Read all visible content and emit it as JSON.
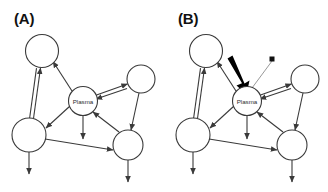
{
  "figure": {
    "background_color": "#ffffff",
    "stroke_color": "#3a3a3a",
    "thick_arrow_color": "#000000",
    "thin_arrow_color": "#8d8d8d"
  },
  "panels": [
    {
      "label": "(A)",
      "center_node_label": "Plasma",
      "node_count": 5,
      "nodes": [
        {
          "id": "top-left",
          "label": "",
          "cx": 42,
          "cy": 51,
          "r": 16.5
        },
        {
          "id": "bottom-left",
          "label": "",
          "cx": 29,
          "cy": 135,
          "r": 17.0
        },
        {
          "id": "plasma",
          "label": "Plasma",
          "cx": 83,
          "cy": 101,
          "r": 14.5
        },
        {
          "id": "right",
          "label": "",
          "cx": 141,
          "cy": 79,
          "r": 14.0
        },
        {
          "id": "bottom-right",
          "label": "",
          "cx": 128,
          "cy": 145,
          "r": 15.0
        }
      ],
      "edges": [
        {
          "from": "bottom-left",
          "to": "top-left",
          "style": "double",
          "arrow": "both"
        },
        {
          "from": "plasma",
          "to": "top-left",
          "style": "single",
          "arrow": "target"
        },
        {
          "from": "plasma",
          "to": "bottom-left",
          "style": "single",
          "arrow": "target"
        },
        {
          "from": "plasma",
          "to": "right",
          "style": "double",
          "arrow": "both"
        },
        {
          "from": "bottom-right",
          "to": "plasma",
          "style": "single",
          "arrow": "target"
        },
        {
          "from": "right",
          "to": "bottom-right",
          "style": "single",
          "arrow": "target"
        },
        {
          "from": "bottom-left",
          "to": "bottom-right",
          "style": "single",
          "arrow": "target"
        },
        {
          "from": "plasma",
          "to": "outflow",
          "style": "single",
          "arrow": "target"
        },
        {
          "from": "bottom-left",
          "to": "outflow",
          "style": "single",
          "arrow": "target"
        },
        {
          "from": "bottom-right",
          "to": "outflow",
          "style": "single",
          "arrow": "target"
        }
      ]
    },
    {
      "label": "(B)",
      "center_node_label": "Plasma",
      "node_count": 5,
      "nodes": [
        {
          "id": "top-left",
          "label": "",
          "cx": 42,
          "cy": 51,
          "r": 16.5
        },
        {
          "id": "bottom-left",
          "label": "",
          "cx": 29,
          "cy": 135,
          "r": 17.0
        },
        {
          "id": "plasma",
          "label": "Plasma",
          "cx": 83,
          "cy": 101,
          "r": 14.5
        },
        {
          "id": "right",
          "label": "",
          "cx": 141,
          "cy": 79,
          "r": 14.0
        },
        {
          "id": "bottom-right",
          "label": "",
          "cx": 128,
          "cy": 145,
          "r": 15.0
        }
      ],
      "edges": [
        {
          "from": "bottom-left",
          "to": "top-left",
          "style": "double",
          "arrow": "both"
        },
        {
          "from": "plasma",
          "to": "top-left",
          "style": "single",
          "arrow": "target"
        },
        {
          "from": "plasma",
          "to": "bottom-left",
          "style": "single",
          "arrow": "target"
        },
        {
          "from": "plasma",
          "to": "right",
          "style": "double",
          "arrow": "both"
        },
        {
          "from": "bottom-right",
          "to": "plasma",
          "style": "single",
          "arrow": "target"
        },
        {
          "from": "right",
          "to": "bottom-right",
          "style": "single",
          "arrow": "target"
        },
        {
          "from": "bottom-left",
          "to": "bottom-right",
          "style": "single",
          "arrow": "target"
        },
        {
          "from": "plasma",
          "to": "outflow",
          "style": "single",
          "arrow": "target"
        },
        {
          "from": "bottom-left",
          "to": "outflow",
          "style": "single",
          "arrow": "target"
        },
        {
          "from": "bottom-right",
          "to": "outflow",
          "style": "single",
          "arrow": "target"
        },
        {
          "from": "external-bold",
          "to": "plasma",
          "style": "thick",
          "arrow": "target"
        },
        {
          "from": "external-thin",
          "to": "plasma",
          "style": "thin",
          "arrow": "source-square"
        }
      ]
    }
  ]
}
